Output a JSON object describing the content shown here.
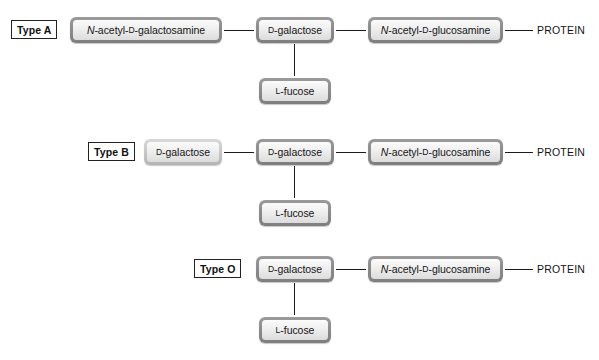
{
  "diagram": {
    "colors": {
      "box_border_dark": "#8c8c8c",
      "box_border_light": "#c9c9c9",
      "box_fill": "#f0f0f0",
      "connector": "#1c1c1c",
      "text": "#141414",
      "background": "#ffffff"
    },
    "rows": [
      {
        "id": "type-a",
        "type_label": "Type A",
        "terminal_sugar": "N-acetyl-D-galactosamine",
        "terminal_sugar_parts": {
          "italic": "N",
          "rest": "-acetyl-",
          "smallcap": "D",
          "tail": "-galactosamine"
        },
        "core_sugar": "D-galactose",
        "core_sugar_parts": {
          "smallcap": "D",
          "tail": "-galactose"
        },
        "link_sugar": "N-acetyl-D-glucosamine",
        "link_sugar_parts": {
          "italic": "N",
          "rest": "-acetyl-",
          "smallcap": "D",
          "tail": "-glucosamine"
        },
        "branch_sugar": "L-fucose",
        "branch_sugar_parts": {
          "smallcap": "L",
          "tail": "-fucose"
        },
        "protein_label": "PROTEIN"
      },
      {
        "id": "type-b",
        "type_label": "Type B",
        "terminal_sugar": "D-galactose",
        "terminal_sugar_parts": {
          "smallcap": "D",
          "tail": "-galactose"
        },
        "core_sugar": "D-galactose",
        "core_sugar_parts": {
          "smallcap": "D",
          "tail": "-galactose"
        },
        "link_sugar": "N-acetyl-D-glucosamine",
        "link_sugar_parts": {
          "italic": "N",
          "rest": "-acetyl-",
          "smallcap": "D",
          "tail": "-glucosamine"
        },
        "branch_sugar": "L-fucose",
        "branch_sugar_parts": {
          "smallcap": "L",
          "tail": "-fucose"
        },
        "protein_label": "PROTEIN"
      },
      {
        "id": "type-o",
        "type_label": "Type O",
        "terminal_sugar": null,
        "core_sugar": "D-galactose",
        "core_sugar_parts": {
          "smallcap": "D",
          "tail": "-galactose"
        },
        "link_sugar": "N-acetyl-D-glucosamine",
        "link_sugar_parts": {
          "italic": "N",
          "rest": "-acetyl-",
          "smallcap": "D",
          "tail": "-glucosamine"
        },
        "branch_sugar": "L-fucose",
        "branch_sugar_parts": {
          "smallcap": "L",
          "tail": "-fucose"
        },
        "protein_label": "PROTEIN"
      }
    ]
  }
}
